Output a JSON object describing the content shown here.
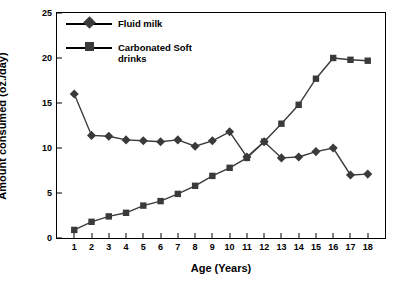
{
  "chart_data": {
    "type": "line",
    "title": "",
    "xlabel": "Age (Years)",
    "ylabel": "Amount consumed (oz./day)",
    "xlim": [
      0,
      19
    ],
    "ylim": [
      0,
      25
    ],
    "ytick_step": 5,
    "yticks": [
      "0",
      "5",
      "10",
      "15",
      "20",
      "25"
    ],
    "xticks": [
      "1",
      "2",
      "3",
      "4",
      "5",
      "6",
      "7",
      "8",
      "9",
      "10",
      "11",
      "12",
      "13",
      "14",
      "15",
      "16",
      "17",
      "18"
    ],
    "x": [
      1,
      2,
      3,
      4,
      5,
      6,
      7,
      8,
      9,
      10,
      11,
      12,
      13,
      14,
      15,
      16,
      17,
      18
    ],
    "grid": false,
    "legend_position": "top-left",
    "series": [
      {
        "name": "Fluid milk",
        "marker": "diamond",
        "color": "#3a3a3a",
        "values": [
          16.0,
          11.4,
          11.3,
          10.9,
          10.8,
          10.7,
          10.9,
          10.2,
          10.8,
          11.8,
          9.0,
          10.7,
          8.9,
          9.0,
          9.6,
          10.0,
          7.0,
          7.1
        ]
      },
      {
        "name": "Carbonated Soft drinks",
        "marker": "square",
        "color": "#3a3a3a",
        "values": [
          0.9,
          1.8,
          2.4,
          2.8,
          3.6,
          4.1,
          4.9,
          5.8,
          6.9,
          7.8,
          8.9,
          10.7,
          12.7,
          14.8,
          17.7,
          20.0,
          19.8,
          19.7
        ]
      }
    ]
  },
  "legend": {
    "items": [
      {
        "label": "Fluid milk"
      },
      {
        "label": "Carbonated Soft drinks"
      }
    ]
  }
}
